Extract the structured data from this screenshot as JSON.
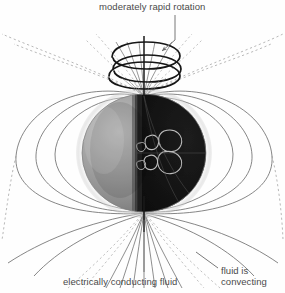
{
  "figure": {
    "background_color": "#fefefe",
    "width": 285,
    "height": 293
  },
  "labels": {
    "rotation": "moderately rapid rotation",
    "conducting_fluid": "electrically conducting fluid",
    "convecting_line1": "fluid is",
    "convecting_line2": "convecting"
  },
  "colors": {
    "text": "#4a4a4a",
    "field_line": "#5a5a5a",
    "dashed_field_line": "#9a9a9a",
    "axis": "#1a1a1a",
    "coil": "#161616",
    "sphere_lit": "#9a9a9a",
    "sphere_dark": "#141414",
    "sphere_limb": "#c9c9c9",
    "convection_cell": "#cfcfcf",
    "leader": "#6a6a6a"
  },
  "geometry": {
    "sphere_center_x": 144,
    "sphere_center_y": 153,
    "sphere_radius_x": 62,
    "sphere_radius_y": 59,
    "north_pole_x": 144,
    "north_pole_y": 94,
    "south_pole_x": 144,
    "south_pole_y": 212
  },
  "elements": {
    "rotation_axis": "vertical rotation axis through poles",
    "rotation_coil": "helical spiral coil of three elliptical turns at north pole",
    "dipole_field": "nested closed magnetic field loops on both hemispheres",
    "convection_cells": "light curved convection cell loops inside dark hemisphere",
    "polar_fan": "field lines fanning outward from south pole",
    "leader_arrow": "arrow from rotation label to coil"
  }
}
